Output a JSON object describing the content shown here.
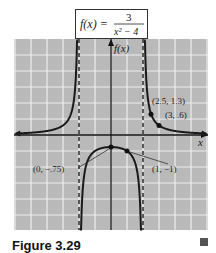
{
  "chart_data": {
    "type": "line",
    "title_parts": {
      "lhs": "f(x) =",
      "numerator": "3",
      "denominator": "x² − 4"
    },
    "xlabel": "x",
    "ylabel": "f(x)",
    "xlim": [
      -6,
      6
    ],
    "ylim": [
      -6,
      6
    ],
    "grid": true,
    "vertical_asymptotes": [
      -2,
      2
    ],
    "horizontal_asymptote": 0,
    "labeled_points": [
      {
        "x": 0,
        "y": -0.75,
        "label": "(0, −.75)"
      },
      {
        "x": 1,
        "y": -1,
        "label": "(1, −1)"
      },
      {
        "x": 2.5,
        "y": 1.3,
        "label": "(2.5, 1.3)"
      },
      {
        "x": 3,
        "y": 0.6,
        "label": "(3, .6)"
      }
    ],
    "series": [
      {
        "name": "left branch",
        "domain": [
          -5.8,
          -2.05
        ]
      },
      {
        "name": "middle branch",
        "domain": [
          -1.95,
          1.95
        ]
      },
      {
        "name": "right branch",
        "domain": [
          2.05,
          5.8
        ]
      }
    ]
  },
  "caption": {
    "text": "Figure 3.29"
  },
  "colors": {
    "grid_bg": "#b9b9b9",
    "grid_line": "#eeeeee",
    "curve": "#1a1a1a"
  }
}
